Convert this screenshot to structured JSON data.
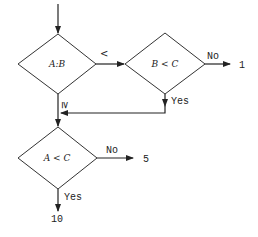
{
  "diagram": {
    "type": "flowchart",
    "nodes": [
      {
        "id": "d1",
        "shape": "diamond",
        "label": "A:B"
      },
      {
        "id": "d2",
        "shape": "diamond",
        "label": "B < C"
      },
      {
        "id": "d3",
        "shape": "diamond",
        "label": "A < C"
      }
    ],
    "edges": [
      {
        "from": "start",
        "to": "d1",
        "label": ""
      },
      {
        "from": "d1",
        "to": "d2",
        "label": "<"
      },
      {
        "from": "d1",
        "to": "d3",
        "label": "≥"
      },
      {
        "from": "d2",
        "to": "out1",
        "label": "No"
      },
      {
        "from": "d2",
        "to": "d3",
        "label": "Yes"
      },
      {
        "from": "d3",
        "to": "out5",
        "label": "No"
      },
      {
        "from": "d3",
        "to": "out10",
        "label": "Yes"
      }
    ],
    "outputs": {
      "out1": "1",
      "out5": "5",
      "out10": "10"
    },
    "labels": {
      "d1_lt": "<",
      "d1_ge": "≥",
      "d2_no": "No",
      "d2_yes": "Yes",
      "d3_no": "No",
      "d3_yes": "Yes"
    }
  }
}
